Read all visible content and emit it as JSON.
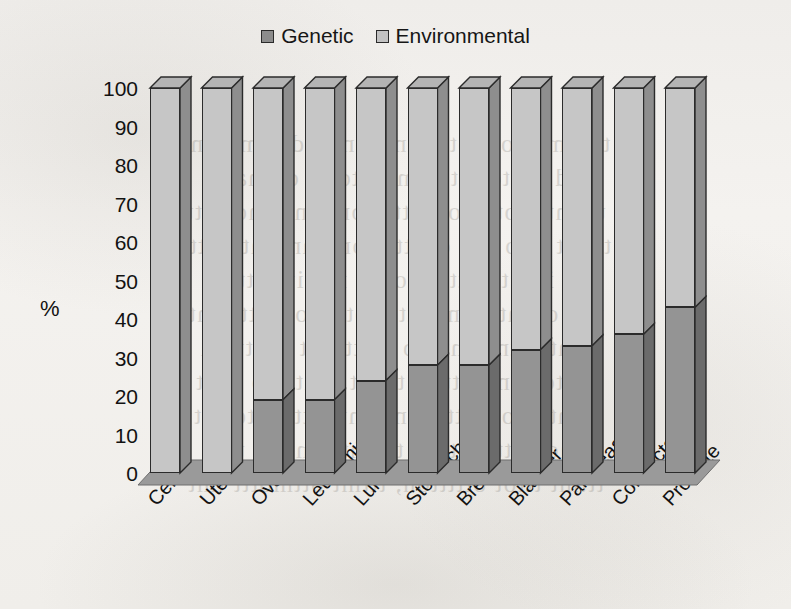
{
  "chart_data": {
    "type": "bar",
    "subtype": "stacked-3d-column",
    "title": "",
    "xlabel": "",
    "ylabel": "%",
    "ylim": [
      0,
      100
    ],
    "yticks": [
      100,
      90,
      80,
      70,
      60,
      50,
      40,
      30,
      20,
      10,
      0
    ],
    "grid": false,
    "legend_position": "top-center",
    "categories": [
      "Cervix",
      "Uterus",
      "Ovary",
      "Leukemia",
      "Lung",
      "Stomach",
      "Breast",
      "Bladder",
      "Pancreas",
      "Colorectal",
      "Prostate"
    ],
    "series": [
      {
        "name": "Genetic",
        "color": "#949494",
        "values": [
          0,
          0,
          19,
          19,
          24,
          28,
          28,
          32,
          33,
          36,
          43
        ]
      },
      {
        "name": "Environmental",
        "color": "#c6c6c6",
        "values": [
          100,
          100,
          81,
          81,
          76,
          72,
          72,
          68,
          67,
          64,
          57
        ]
      }
    ]
  },
  "legend": {
    "items": [
      {
        "label": "Genetic",
        "swatch": "genetic"
      },
      {
        "label": "Environmental",
        "swatch": "environmental"
      }
    ]
  },
  "axis": {
    "y_title": "%"
  },
  "page_bleed": {
    "lines": [
      "ttnomtutom ottammiton ta dtermatont",
      "ind tnotomit ittmonito dt ottmatttt",
      "uttmtm otttitomt tt mom ontttmontitt",
      "tttott tmo mtt ottitttmomt anttmto bttt",
      "tt itm tmotttt ttomtt mtnitt tttt tt",
      "tmt ottmttmtmtt ttot otmt otmtttmint",
      "omtttotnt tmtttto tt tttm tt ttmttton",
      "tt ttottommttt ot ttottt ttmt nto tttot",
      "mmtttttomtttt totmt tnt mttt ottottot",
      "tmot tttttmtt tm ttttmttt mttttt tt tt",
      "tttmt tttot ottttton, tttmt ottmottt tmt"
    ]
  }
}
